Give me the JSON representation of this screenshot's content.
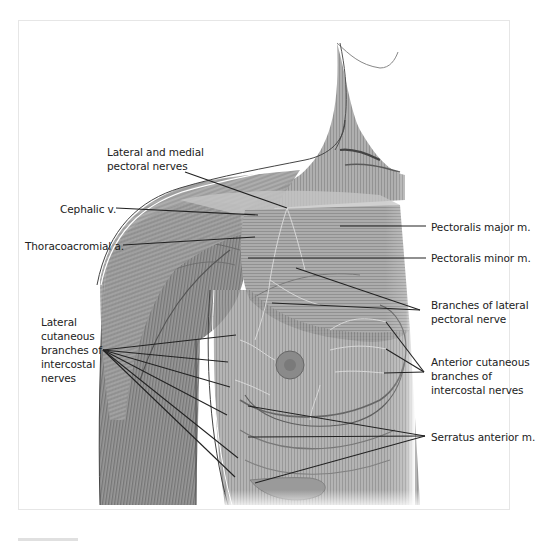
{
  "figure": {
    "region": "Right shoulder and anterior thoracic wall",
    "labels": [
      {
        "id": "lateral-medial-pectoral",
        "text": "Lateral and medial\npectoral nerves",
        "x": 107,
        "y": 145,
        "align": "left"
      },
      {
        "id": "cephalic-v",
        "text": "Cephalic v.",
        "x": 60,
        "y": 202,
        "align": "left"
      },
      {
        "id": "thoracoacromial-a",
        "text": "Thoracoacromial a.",
        "x": 25,
        "y": 239,
        "align": "left"
      },
      {
        "id": "lateral-cutaneous",
        "text": "Lateral\ncutaneous\nbranches of\nintercostal\nnerves",
        "x": 41,
        "y": 315,
        "align": "left"
      },
      {
        "id": "pectoralis-major",
        "text": "Pectoralis major m.",
        "x": 431,
        "y": 220,
        "align": "left"
      },
      {
        "id": "pectoralis-minor",
        "text": "Pectoralis minor m.",
        "x": 431,
        "y": 251,
        "align": "left"
      },
      {
        "id": "branches-lateral-pectoral",
        "text": "Branches of lateral\npectoral nerve",
        "x": 431,
        "y": 298,
        "align": "left"
      },
      {
        "id": "anterior-cutaneous",
        "text": "Anterior cutaneous\nbranches of\nintercostal nerves",
        "x": 431,
        "y": 355,
        "align": "left"
      },
      {
        "id": "serratus-anterior",
        "text": "Serratus anterior m.",
        "x": 431,
        "y": 430,
        "align": "left"
      }
    ],
    "leaders": [
      {
        "label": "lateral-medial-pectoral",
        "from": [
          185,
          172
        ],
        "to": [
          287,
          208
        ]
      },
      {
        "label": "cephalic-v",
        "from": [
          116,
          208
        ],
        "to": [
          258,
          215
        ]
      },
      {
        "label": "thoracoacromial-a",
        "from": [
          123,
          245
        ],
        "to": [
          255,
          237
        ]
      },
      {
        "label": "lateral-cutaneous",
        "from": [
          103,
          350
        ],
        "to": [
          236,
          335
        ]
      },
      {
        "label": "lateral-cutaneous",
        "from": [
          103,
          350
        ],
        "to": [
          228,
          362
        ]
      },
      {
        "label": "lateral-cutaneous",
        "from": [
          103,
          350
        ],
        "to": [
          230,
          387
        ]
      },
      {
        "label": "lateral-cutaneous",
        "from": [
          103,
          350
        ],
        "to": [
          227,
          415
        ]
      },
      {
        "label": "lateral-cutaneous",
        "from": [
          103,
          350
        ],
        "to": [
          238,
          458
        ]
      },
      {
        "label": "lateral-cutaneous",
        "from": [
          103,
          350
        ],
        "to": [
          235,
          477
        ]
      },
      {
        "label": "pectoralis-major",
        "from": [
          340,
          226
        ],
        "to": [
          426,
          226
        ]
      },
      {
        "label": "pectoralis-minor",
        "from": [
          248,
          258
        ],
        "to": [
          426,
          258
        ]
      },
      {
        "label": "branches-lateral-pectoral",
        "from": [
          296,
          268
        ],
        "to": [
          420,
          310
        ]
      },
      {
        "label": "branches-lateral-pectoral",
        "from": [
          272,
          303
        ],
        "to": [
          420,
          310
        ]
      },
      {
        "label": "anterior-cutaneous",
        "from": [
          386,
          322
        ],
        "to": [
          424,
          372
        ]
      },
      {
        "label": "anterior-cutaneous",
        "from": [
          386,
          349
        ],
        "to": [
          424,
          372
        ]
      },
      {
        "label": "anterior-cutaneous",
        "from": [
          384,
          373
        ],
        "to": [
          424,
          372
        ]
      },
      {
        "label": "serratus-anterior",
        "from": [
          248,
          406
        ],
        "to": [
          425,
          436
        ]
      },
      {
        "label": "serratus-anterior",
        "from": [
          248,
          437
        ],
        "to": [
          425,
          436
        ]
      },
      {
        "label": "serratus-anterior",
        "from": [
          255,
          483
        ],
        "to": [
          425,
          436
        ]
      }
    ],
    "colors": {
      "muscle": "#8f8f8f",
      "muscle_dark": "#6e6e6e",
      "muscle_light": "#b9b9b9",
      "skin_outline": "#555555",
      "leader": "#222222",
      "text": "#222222"
    }
  }
}
